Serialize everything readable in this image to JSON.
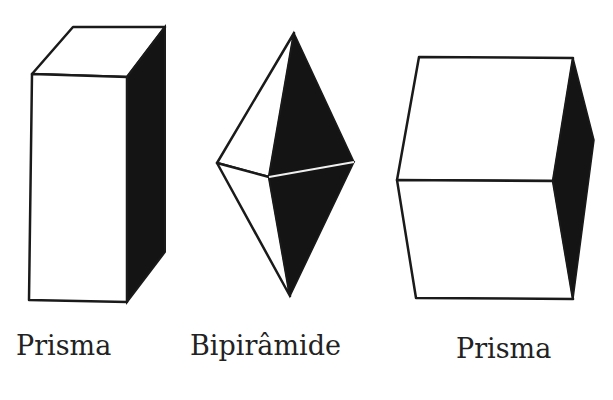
{
  "figures": [
    {
      "id": "prism-tall",
      "label": "Prisma"
    },
    {
      "id": "bipyramid",
      "label": "Bipirâmide"
    },
    {
      "id": "prism-wide",
      "label": "Prisma"
    }
  ],
  "colors": {
    "stroke": "#1a1a1a",
    "shade": "#141414",
    "face": "#ffffff"
  }
}
